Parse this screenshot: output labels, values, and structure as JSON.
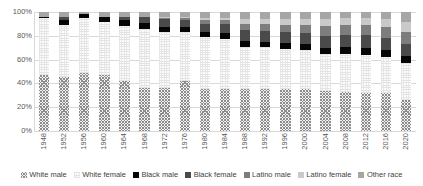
{
  "chart_data": {
    "type": "bar",
    "subtype": "stacked-100-percent",
    "title": "",
    "xlabel": "",
    "ylabel": "",
    "ylim": [
      0,
      100
    ],
    "yticks": [
      "0%",
      "20%",
      "40%",
      "60%",
      "80%",
      "100%"
    ],
    "ytick_values": [
      0,
      20,
      40,
      60,
      80,
      100
    ],
    "grid": true,
    "legend_position": "bottom",
    "categories": [
      "1948",
      "1952",
      "1956",
      "1960",
      "1964",
      "1968",
      "1972",
      "1976",
      "1980",
      "1984",
      "1988",
      "1992",
      "1996",
      "2000",
      "2004",
      "2008",
      "2012",
      "2016",
      "2020"
    ],
    "series": [
      {
        "name": "White male",
        "color": "#8c8c8c",
        "pattern": "crosshatch",
        "values": [
          47,
          45,
          49,
          47,
          42,
          36,
          36,
          42,
          35,
          35,
          35,
          35,
          35,
          35,
          34,
          33,
          32,
          32,
          26
        ]
      },
      {
        "name": "White female",
        "color": "#fdfdfd",
        "pattern": "fine-dot",
        "values": [
          48,
          44,
          46,
          45,
          46,
          50,
          47,
          41,
          44,
          42,
          36,
          36,
          34,
          33,
          31,
          32,
          32,
          30,
          31
        ]
      },
      {
        "name": "Black male",
        "color": "#050505",
        "pattern": "solid",
        "values": [
          1,
          4,
          3,
          4,
          5,
          5,
          4,
          4,
          4,
          5,
          5,
          4,
          5,
          5,
          5,
          6,
          6,
          6,
          6
        ]
      },
      {
        "name": "Black female",
        "color": "#4a4a4a",
        "pattern": "solid",
        "values": [
          0,
          3,
          0,
          0,
          3,
          5,
          7,
          6,
          7,
          8,
          9,
          9,
          9,
          9,
          10,
          10,
          11,
          10,
          10
        ]
      },
      {
        "name": "Latino male",
        "color": "#7d7d7d",
        "pattern": "solid",
        "values": [
          0,
          0,
          0,
          0,
          0,
          0,
          1,
          2,
          3,
          3,
          5,
          6,
          6,
          7,
          8,
          8,
          8,
          9,
          10
        ]
      },
      {
        "name": "Latino female",
        "color": "#c9c9c9",
        "pattern": "light",
        "values": [
          0,
          0,
          0,
          0,
          0,
          0,
          1,
          1,
          2,
          2,
          4,
          4,
          5,
          5,
          6,
          6,
          6,
          7,
          9
        ]
      },
      {
        "name": "Other race",
        "color": "#a6a6a6",
        "pattern": "light-gray",
        "values": [
          4,
          4,
          2,
          4,
          4,
          4,
          4,
          4,
          5,
          5,
          6,
          6,
          6,
          6,
          6,
          5,
          5,
          6,
          8
        ]
      }
    ]
  },
  "legend": {
    "items": [
      {
        "label": "White male",
        "key": "white-male"
      },
      {
        "label": "White female",
        "key": "white-female"
      },
      {
        "label": "Black male",
        "key": "black-male"
      },
      {
        "label": "Black female",
        "key": "black-female"
      },
      {
        "label": "Latino male",
        "key": "latino-male"
      },
      {
        "label": "Latino female",
        "key": "latino-female"
      },
      {
        "label": "Other race",
        "key": "other-race"
      }
    ]
  }
}
